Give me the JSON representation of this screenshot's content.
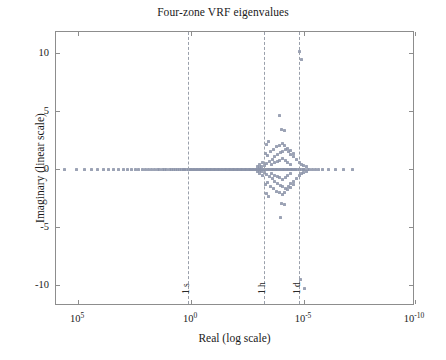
{
  "chart_data": {
    "type": "scatter",
    "title": "Four-zone VRF eigenvalues",
    "xlabel": "Real (log scale)",
    "ylabel": "Imaginary (linear scale)",
    "xscale": "log-reversed",
    "yscale": "linear",
    "xlim": [
      100000,
      1e-10
    ],
    "ylim": [
      -11.8,
      11.8
    ],
    "grid": false,
    "legend": null,
    "xticks": [
      {
        "value": 100000,
        "label": "10",
        "exponent": "5",
        "px": 77
      },
      {
        "value": 1,
        "label": "10",
        "exponent": "0",
        "px": 190
      },
      {
        "value": 1e-05,
        "label": "10",
        "exponent": "-5",
        "px": 303
      },
      {
        "value": 1e-10,
        "label": "10",
        "exponent": "-10",
        "px": 414
      }
    ],
    "yticks": [
      {
        "value": 10,
        "label": "10"
      },
      {
        "value": 5,
        "label": "5"
      },
      {
        "value": 0,
        "label": "0"
      },
      {
        "value": -5,
        "label": "-5"
      },
      {
        "value": -10,
        "label": "-10"
      }
    ],
    "marker": {
      "shape": "square",
      "color": "#8b93a8",
      "size": 3
    },
    "reference_lines": [
      {
        "label": "1 s",
        "x_exponent": -0.02,
        "px": 187,
        "style": "dashed",
        "color": "#9aa0ab"
      },
      {
        "label": "1 h",
        "x_exponent": -3.38,
        "px": 263,
        "style": "dashed",
        "color": "#9aa0ab"
      },
      {
        "label": "1 d",
        "x_exponent": -4.94,
        "px": 298,
        "style": "dashed",
        "color": "#9aa0ab"
      }
    ],
    "points": [
      [
        -4.86,
        10.1
      ],
      [
        -4.97,
        9.4
      ],
      [
        -3.98,
        4.6
      ],
      [
        -4.05,
        3.4
      ],
      [
        -4.18,
        3.3
      ],
      [
        -4.18,
        -3.1
      ],
      [
        -4.07,
        -3.0
      ],
      [
        -4.02,
        -4.2
      ],
      [
        -4.92,
        -9.5
      ],
      [
        -5.1,
        -10.3
      ],
      [
        6.05,
        0
      ],
      [
        5.62,
        0
      ],
      [
        5.08,
        0
      ],
      [
        4.72,
        0
      ],
      [
        4.4,
        0
      ],
      [
        4.12,
        0
      ],
      [
        3.88,
        0
      ],
      [
        3.64,
        0
      ],
      [
        3.41,
        0
      ],
      [
        3.2,
        0
      ],
      [
        2.98,
        0
      ],
      [
        2.8,
        0
      ],
      [
        2.62,
        0
      ],
      [
        2.45,
        0
      ],
      [
        2.3,
        0
      ],
      [
        2.14,
        0
      ],
      [
        2.0,
        0
      ],
      [
        1.86,
        0
      ],
      [
        1.72,
        0
      ],
      [
        1.6,
        0
      ],
      [
        1.48,
        0
      ],
      [
        1.36,
        0
      ],
      [
        1.25,
        0
      ],
      [
        1.14,
        0
      ],
      [
        1.04,
        0
      ],
      [
        0.94,
        0
      ],
      [
        0.84,
        0
      ],
      [
        0.75,
        0
      ],
      [
        0.66,
        0
      ],
      [
        0.57,
        0
      ],
      [
        0.48,
        0
      ],
      [
        0.4,
        0
      ],
      [
        0.32,
        0
      ],
      [
        0.24,
        0
      ],
      [
        0.16,
        0
      ],
      [
        0.08,
        0
      ],
      [
        0.01,
        0
      ],
      [
        -0.06,
        0
      ],
      [
        -0.13,
        0
      ],
      [
        -0.2,
        0
      ],
      [
        -0.27,
        0
      ],
      [
        -0.34,
        0
      ],
      [
        -0.4,
        0
      ],
      [
        -0.47,
        0
      ],
      [
        -0.53,
        0
      ],
      [
        -0.6,
        0
      ],
      [
        -0.66,
        0
      ],
      [
        -0.72,
        0
      ],
      [
        -0.78,
        0
      ],
      [
        -0.84,
        0
      ],
      [
        -0.9,
        0
      ],
      [
        -0.96,
        0
      ],
      [
        -1.02,
        0
      ],
      [
        -1.08,
        0
      ],
      [
        -1.14,
        0
      ],
      [
        -1.2,
        0
      ],
      [
        -1.26,
        0
      ],
      [
        -1.32,
        0
      ],
      [
        -1.38,
        0
      ],
      [
        -1.44,
        0
      ],
      [
        -1.5,
        0
      ],
      [
        -1.56,
        0
      ],
      [
        -1.62,
        0
      ],
      [
        -1.68,
        0
      ],
      [
        -1.74,
        0
      ],
      [
        -1.8,
        0
      ],
      [
        -1.86,
        0
      ],
      [
        -1.92,
        0
      ],
      [
        -1.98,
        0
      ],
      [
        -2.04,
        0
      ],
      [
        -2.1,
        0
      ],
      [
        -2.16,
        0
      ],
      [
        -2.22,
        0
      ],
      [
        -2.28,
        0
      ],
      [
        -2.34,
        0
      ],
      [
        -2.4,
        0
      ],
      [
        -2.46,
        0
      ],
      [
        -2.52,
        0
      ],
      [
        -2.58,
        0
      ],
      [
        -2.64,
        0
      ],
      [
        -2.7,
        0
      ],
      [
        -2.76,
        0
      ],
      [
        -2.82,
        0
      ],
      [
        -2.88,
        0
      ],
      [
        -2.94,
        0
      ],
      [
        -3.0,
        0
      ],
      [
        -3.06,
        0
      ],
      [
        -3.12,
        0
      ],
      [
        -3.18,
        0
      ],
      [
        -3.24,
        0
      ],
      [
        -3.3,
        0
      ],
      [
        -3.36,
        0
      ],
      [
        -3.42,
        0
      ],
      [
        -3.48,
        0
      ],
      [
        -3.54,
        0
      ],
      [
        -3.6,
        0
      ],
      [
        -3.66,
        0
      ],
      [
        -3.72,
        0
      ],
      [
        -3.78,
        0
      ],
      [
        -3.84,
        0
      ],
      [
        -3.9,
        0
      ],
      [
        -3.96,
        0
      ],
      [
        -4.02,
        0
      ],
      [
        -4.08,
        0
      ],
      [
        -4.14,
        0
      ],
      [
        -4.2,
        0
      ],
      [
        -4.26,
        0
      ],
      [
        -4.32,
        0
      ],
      [
        -4.38,
        0
      ],
      [
        -4.44,
        0
      ],
      [
        -4.5,
        0
      ],
      [
        -4.56,
        0
      ],
      [
        -4.62,
        0
      ],
      [
        -4.7,
        0
      ],
      [
        -4.78,
        0
      ],
      [
        -4.86,
        0
      ],
      [
        -4.94,
        0
      ],
      [
        -5.02,
        0
      ],
      [
        -5.1,
        0
      ],
      [
        -5.2,
        0
      ],
      [
        -5.3,
        0
      ],
      [
        -5.42,
        0
      ],
      [
        -5.55,
        0
      ],
      [
        -5.7,
        0
      ],
      [
        -5.9,
        0
      ],
      [
        -6.15,
        0
      ],
      [
        -6.45,
        0
      ],
      [
        -6.8,
        0
      ],
      [
        -7.2,
        0
      ],
      [
        -3.4,
        0.45
      ],
      [
        -3.4,
        -0.45
      ],
      [
        -3.52,
        0.62
      ],
      [
        -3.52,
        -0.62
      ],
      [
        -3.64,
        0.85
      ],
      [
        -3.64,
        -0.85
      ],
      [
        -3.76,
        1.05
      ],
      [
        -3.76,
        -1.05
      ],
      [
        -3.88,
        1.22
      ],
      [
        -3.88,
        -1.22
      ],
      [
        -4.0,
        1.42
      ],
      [
        -4.0,
        -1.42
      ],
      [
        -4.12,
        1.55
      ],
      [
        -4.12,
        -1.55
      ],
      [
        -4.24,
        1.68
      ],
      [
        -4.24,
        -1.68
      ],
      [
        -4.36,
        1.48
      ],
      [
        -4.36,
        -1.48
      ],
      [
        -4.48,
        1.25
      ],
      [
        -4.48,
        -1.25
      ],
      [
        -4.6,
        1.05
      ],
      [
        -4.6,
        -1.05
      ],
      [
        -4.72,
        0.82
      ],
      [
        -4.72,
        -0.82
      ],
      [
        -4.84,
        0.6
      ],
      [
        -4.84,
        -0.6
      ],
      [
        -4.96,
        0.38
      ],
      [
        -4.96,
        -0.38
      ],
      [
        -3.3,
        0.3
      ],
      [
        -3.3,
        -0.3
      ],
      [
        -3.18,
        0.22
      ],
      [
        -3.18,
        -0.22
      ],
      [
        -3.06,
        0.15
      ],
      [
        -3.06,
        -0.15
      ],
      [
        -3.45,
        1.15
      ],
      [
        -3.45,
        -1.15
      ],
      [
        -3.33,
        1.35
      ],
      [
        -3.33,
        -1.35
      ],
      [
        -3.58,
        1.5
      ],
      [
        -3.58,
        -1.5
      ],
      [
        -3.7,
        1.72
      ],
      [
        -3.7,
        -1.72
      ],
      [
        -3.82,
        1.92
      ],
      [
        -3.82,
        -1.92
      ],
      [
        -3.95,
        2.05
      ],
      [
        -3.95,
        -2.05
      ],
      [
        -4.08,
        2.18
      ],
      [
        -4.08,
        -2.18
      ],
      [
        -4.2,
        2.02
      ],
      [
        -4.2,
        -2.02
      ],
      [
        -4.32,
        1.8
      ],
      [
        -4.32,
        -1.8
      ],
      [
        -4.45,
        1.58
      ],
      [
        -4.45,
        -1.58
      ],
      [
        -4.58,
        1.32
      ],
      [
        -4.58,
        -1.32
      ],
      [
        -3.62,
        0.35
      ],
      [
        -3.62,
        -0.35
      ],
      [
        -3.74,
        0.52
      ],
      [
        -3.74,
        -0.52
      ],
      [
        -3.86,
        0.68
      ],
      [
        -3.86,
        -0.68
      ],
      [
        -3.98,
        0.75
      ],
      [
        -3.98,
        -0.75
      ],
      [
        -4.1,
        0.92
      ],
      [
        -4.1,
        -0.92
      ],
      [
        -4.22,
        0.7
      ],
      [
        -4.22,
        -0.7
      ],
      [
        -4.34,
        0.55
      ],
      [
        -4.34,
        -0.55
      ],
      [
        -4.46,
        0.42
      ],
      [
        -4.46,
        -0.42
      ],
      [
        -3.2,
        0.55
      ],
      [
        -3.2,
        -0.55
      ],
      [
        -3.1,
        0.38
      ],
      [
        -3.1,
        -0.38
      ],
      [
        -2.98,
        0.25
      ],
      [
        -2.98,
        -0.25
      ],
      [
        -5.05,
        0.28
      ],
      [
        -5.05,
        -0.28
      ],
      [
        -5.18,
        0.2
      ],
      [
        -5.18,
        -0.2
      ],
      [
        -3.5,
        2.35
      ],
      [
        -3.5,
        -2.35
      ],
      [
        -3.38,
        2.1
      ],
      [
        -3.38,
        -2.1
      ]
    ]
  }
}
